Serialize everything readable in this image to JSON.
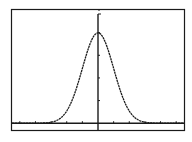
{
  "chart_data": {
    "type": "line",
    "title": "",
    "xlabel": "",
    "ylabel": "",
    "function": "normalpdf(X, 0, 1)",
    "xlim": [
      -5.5,
      5.5
    ],
    "ylim": [
      -0.03,
      0.5
    ],
    "xscl": 1,
    "yscl": 0.1,
    "grid": false,
    "legend": null,
    "x": [
      -4,
      -3.5,
      -3,
      -2.5,
      -2,
      -1.5,
      -1,
      -0.5,
      0,
      0.5,
      1,
      1.5,
      2,
      2.5,
      3,
      3.5,
      4
    ],
    "series": [
      {
        "name": "Y1",
        "values": [
          0.0001,
          0.0009,
          0.0044,
          0.0175,
          0.054,
          0.1295,
          0.242,
          0.3521,
          0.3989,
          0.3521,
          0.242,
          0.1295,
          0.054,
          0.0175,
          0.0044,
          0.0009,
          0.0001
        ]
      }
    ],
    "peak": {
      "x": 0,
      "y": 0.3989
    }
  },
  "screen": {
    "frame_color": "#1a1a1a",
    "curve_color": "#1a1a1a",
    "background": "#ffffff"
  }
}
